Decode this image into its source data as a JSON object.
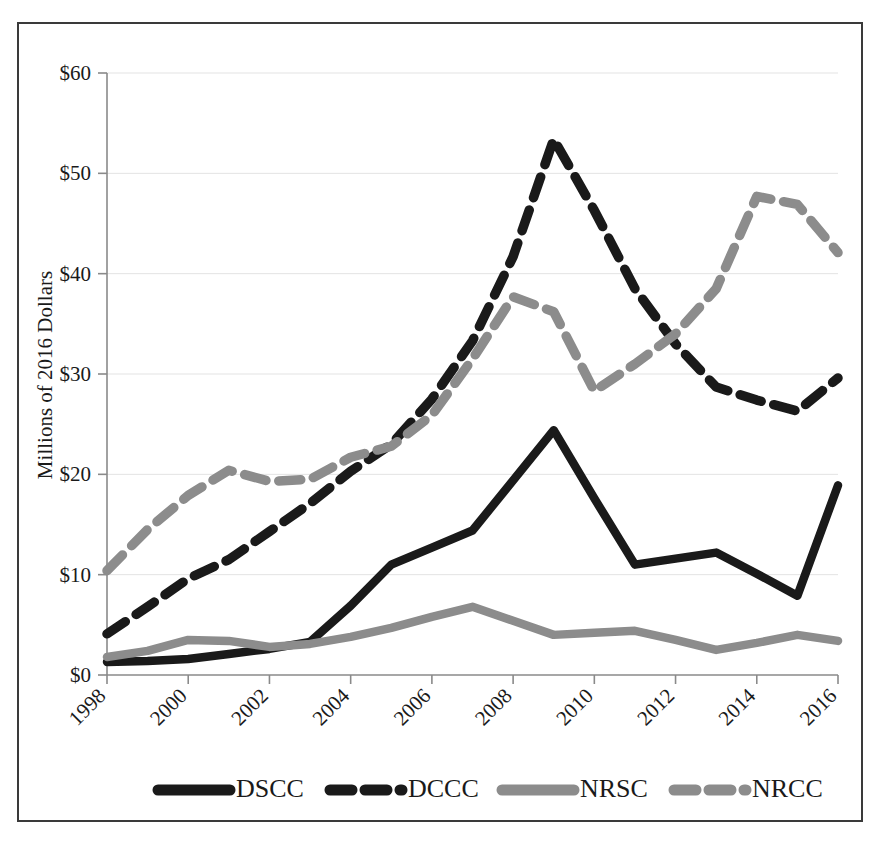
{
  "chart_data": {
    "type": "line",
    "title": "",
    "subtitle": "",
    "xlabel": "",
    "ylabel": "Millions of 2016 Dollars",
    "xlim": [
      1998,
      2016
    ],
    "ylim": [
      0,
      60
    ],
    "grid": true,
    "legend_position": "bottom",
    "x": [
      1998,
      1999,
      2000,
      2001,
      2002,
      2003,
      2004,
      2005,
      2006,
      2007,
      2008,
      2009,
      2010,
      2011,
      2012,
      2013,
      2014,
      2015,
      2016
    ],
    "x_tick_labels": [
      "1998",
      "2000",
      "2002",
      "2004",
      "2006",
      "2008",
      "2010",
      "2012",
      "2014",
      "2016"
    ],
    "x_ticks": [
      1998,
      2000,
      2002,
      2004,
      2006,
      2008,
      2010,
      2012,
      2014,
      2016
    ],
    "y_tick_labels": [
      "$0",
      "$10",
      "$20",
      "$30",
      "$40",
      "$50",
      "$60"
    ],
    "y_ticks": [
      0,
      10,
      20,
      30,
      40,
      50,
      60
    ],
    "series": [
      {
        "name": "DSCC",
        "style": "solid",
        "color": "#1a1a1a",
        "values": [
          1.3,
          1.4,
          1.6,
          2.1,
          2.6,
          3.3,
          6.9,
          11.0,
          12.7,
          14.4,
          19.4,
          24.4,
          17.6,
          11.0,
          11.6,
          12.2,
          10.1,
          7.9,
          18.9
        ]
      },
      {
        "name": "DCCC",
        "style": "dashed",
        "color": "#1a1a1a",
        "values": [
          4.1,
          6.8,
          9.6,
          11.5,
          14.3,
          17.1,
          20.3,
          23.0,
          27.5,
          33.3,
          41.7,
          53.4,
          46.3,
          38.5,
          33.0,
          28.7,
          27.4,
          26.3,
          29.6
        ]
      },
      {
        "name": "NRSC",
        "style": "solid",
        "color": "#8c8c8c",
        "values": [
          1.8,
          2.4,
          3.5,
          3.4,
          2.8,
          3.1,
          3.8,
          4.7,
          5.8,
          6.8,
          5.4,
          4.0,
          4.2,
          4.4,
          3.5,
          2.5,
          3.2,
          4.0,
          3.4
        ]
      },
      {
        "name": "NRCC",
        "style": "dashed",
        "color": "#8c8c8c",
        "values": [
          10.4,
          14.5,
          17.9,
          20.4,
          19.3,
          19.5,
          21.7,
          22.8,
          25.9,
          31.5,
          37.7,
          36.2,
          28.3,
          31.0,
          34.0,
          38.5,
          47.7,
          46.9,
          42.1
        ]
      }
    ],
    "series_override_note": ""
  },
  "legend": {
    "items": [
      {
        "label": "DSCC",
        "style": "solid",
        "color": "#1a1a1a"
      },
      {
        "label": "DCCC",
        "style": "dashed",
        "color": "#1a1a1a"
      },
      {
        "label": "NRSC",
        "style": "solid",
        "color": "#8c8c8c"
      },
      {
        "label": "NRCC",
        "style": "dashed",
        "color": "#8c8c8c"
      }
    ]
  },
  "axis": {
    "y_title": "Millions of 2016 Dollars"
  }
}
